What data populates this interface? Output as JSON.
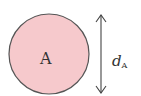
{
  "diagram": {
    "circle": {
      "label": "A",
      "fill": "#f6c9cc",
      "stroke": "#555555"
    },
    "dimension": {
      "symbol": "d",
      "subscript": "A",
      "stroke": "#444444"
    }
  }
}
